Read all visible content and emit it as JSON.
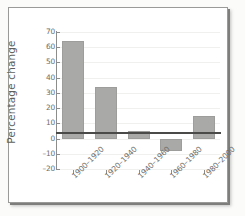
{
  "chart_data": {
    "type": "bar",
    "title": "",
    "xlabel": "",
    "ylabel": "Percentage change",
    "categories": [
      "1900–1920",
      "1920–1940",
      "1940–1960",
      "1960–1980",
      "1980–2000"
    ],
    "values": [
      64,
      34,
      5,
      -8,
      15
    ],
    "ylim": [
      -20,
      70
    ],
    "yticks": [
      70,
      60,
      50,
      40,
      30,
      20,
      10,
      0,
      -10,
      -20
    ],
    "ytick_labels": [
      "70",
      "60",
      "50",
      "40",
      "30",
      "20",
      "10",
      "0",
      "–10",
      "–20"
    ],
    "grid": true,
    "legend": null,
    "series": [
      {
        "name": "Percentage change",
        "values": [
          64,
          34,
          5,
          -8,
          15
        ]
      }
    ],
    "bar_color": "#a9a9a7",
    "axis_color": "#8d8d8b",
    "baseline_color": "#4a4a48",
    "background": "#ffffff"
  },
  "figure": {
    "frame_border_color": "#9a9a98",
    "page_background": "#fbfbfa"
  }
}
